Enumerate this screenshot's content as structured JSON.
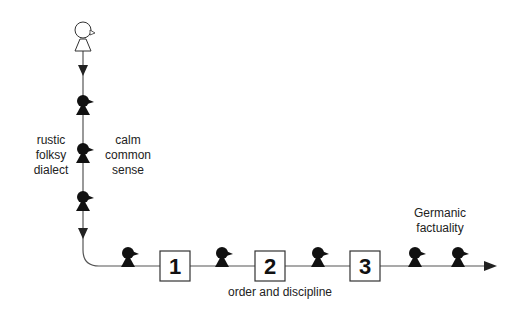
{
  "diagram": {
    "start_figure": "open-figure",
    "labels": {
      "left": "rustic\nfolksy\ndialect",
      "right": "calm\ncommon\nsense",
      "bottom": "order and discipline",
      "top_right": "Germanic\nfactuality"
    },
    "steps": [
      {
        "label": "1"
      },
      {
        "label": "2"
      },
      {
        "label": "3"
      }
    ],
    "colors": {
      "line": "#555555",
      "figure": "#111111",
      "box_border": "#333333"
    }
  }
}
